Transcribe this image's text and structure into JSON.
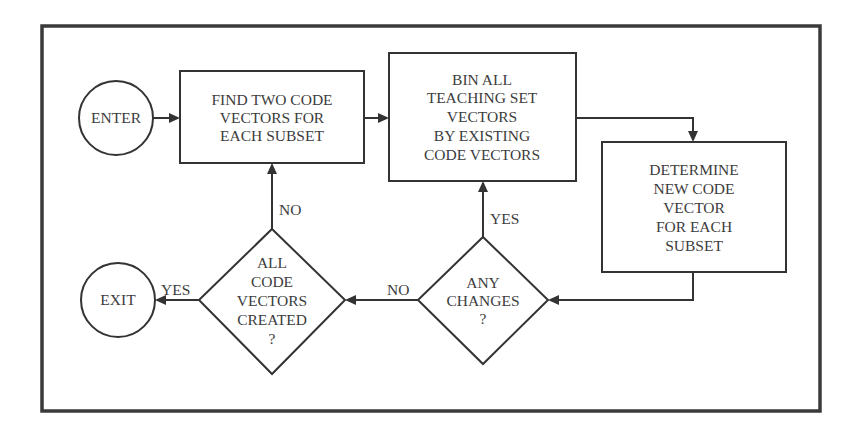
{
  "diagram": {
    "type": "flowchart",
    "nodes": {
      "enter": {
        "shape": "circle",
        "lines": [
          "ENTER"
        ]
      },
      "find": {
        "shape": "rect",
        "lines": [
          "FIND TWO CODE",
          "VECTORS FOR",
          "EACH SUBSET"
        ]
      },
      "bin": {
        "shape": "rect",
        "lines": [
          "BIN ALL",
          "TEACHING SET",
          "VECTORS",
          "BY EXISTING",
          "CODE VECTORS"
        ]
      },
      "determine": {
        "shape": "rect",
        "lines": [
          "DETERMINE",
          "NEW CODE",
          "VECTOR",
          "FOR EACH",
          "SUBSET"
        ]
      },
      "changes": {
        "shape": "diamond",
        "lines": [
          "ANY",
          "CHANGES",
          "?"
        ]
      },
      "all_created": {
        "shape": "diamond",
        "lines": [
          "ALL",
          "CODE",
          "VECTORS",
          "CREATED",
          "?"
        ]
      },
      "exit": {
        "shape": "circle",
        "lines": [
          "EXIT"
        ]
      }
    },
    "edges": [
      {
        "from": "enter",
        "to": "find",
        "label": ""
      },
      {
        "from": "find",
        "to": "bin",
        "label": ""
      },
      {
        "from": "bin",
        "to": "determine",
        "label": ""
      },
      {
        "from": "determine",
        "to": "changes",
        "label": ""
      },
      {
        "from": "changes",
        "to": "bin",
        "label": "YES"
      },
      {
        "from": "changes",
        "to": "all_created",
        "label": "NO"
      },
      {
        "from": "all_created",
        "to": "find",
        "label": "NO"
      },
      {
        "from": "all_created",
        "to": "exit",
        "label": "YES"
      }
    ],
    "edge_labels": {
      "changes_yes": "YES",
      "changes_no": "NO",
      "all_created_no": "NO",
      "all_created_yes": "YES"
    },
    "colors": {
      "line": "#333333",
      "text": "#3c3c3c",
      "background": "#ffffff"
    }
  }
}
